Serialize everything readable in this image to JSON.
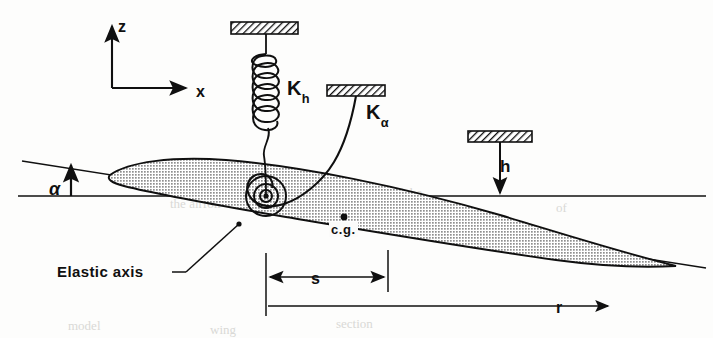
{
  "figure": {
    "background_color": "#fdfdfc",
    "ink_color": "#101010",
    "wing_fill_color": "#a8a8a8"
  },
  "axes": {
    "vertical_label": "z",
    "horizontal_label": "x",
    "origin_px": [
      112,
      88
    ],
    "z_tip_px": [
      112,
      22
    ],
    "x_tip_px": [
      190,
      88
    ]
  },
  "springs": {
    "plunge": {
      "label": "K",
      "subscript": "h",
      "type": "helical-coil",
      "coil_count": 6,
      "support_block_px": [
        231,
        22,
        67,
        12
      ],
      "attach_point_px": [
        266,
        196
      ]
    },
    "torsion": {
      "label": "K",
      "subscript": "α",
      "type": "curved-torsion-arm",
      "support_block_px": [
        327,
        85,
        58,
        11
      ],
      "attach_point_px": [
        266,
        196
      ]
    }
  },
  "plunge_reference": {
    "label": "h",
    "support_block_px": [
      468,
      131,
      64,
      11
    ],
    "arrow_from_px": [
      500,
      142
    ],
    "arrow_to_px": [
      500,
      196
    ]
  },
  "angle": {
    "label": "α",
    "description": "angle of attack between chord line and horizontal reference"
  },
  "annotations": {
    "elastic_axis_label": "Elastic axis",
    "center_of_gravity_label": "c.g."
  },
  "dimensions": [
    {
      "label": "s",
      "arrow_style": "double",
      "from_px": [
        266,
        277
      ],
      "to_px": [
        388,
        277
      ],
      "description": "distance from elastic axis to center of gravity"
    },
    {
      "label": "r",
      "arrow_style": "single-right",
      "from_px": [
        266,
        306
      ],
      "to_px": [
        612,
        306
      ],
      "description": "distance from elastic axis to reference point"
    }
  ],
  "bleed_through_text": [
    {
      "text": "the airfoil",
      "left_px": 170,
      "top_px": 196
    },
    {
      "text": "of the",
      "left_px": 392,
      "top_px": 185
    },
    {
      "text": "of",
      "left_px": 556,
      "top_px": 200
    },
    {
      "text": "wing",
      "left_px": 210,
      "top_px": 322
    },
    {
      "text": "section",
      "left_px": 336,
      "top_px": 316
    },
    {
      "text": "model",
      "left_px": 68,
      "top_px": 318
    }
  ]
}
